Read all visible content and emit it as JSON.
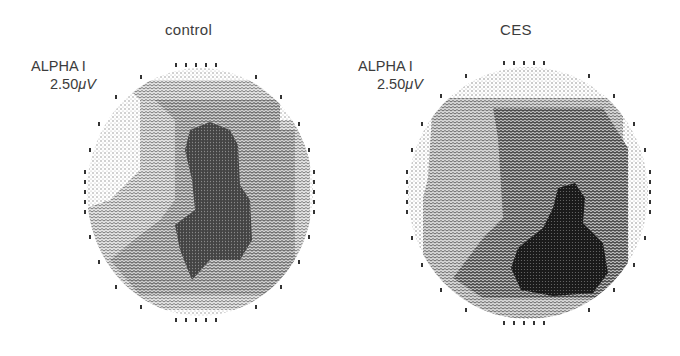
{
  "figure": {
    "panels": [
      {
        "id": "control",
        "title": "control",
        "band": "ALPHA I",
        "scale_value": "2.50",
        "scale_unit_prefix": "μ",
        "scale_unit": "V"
      },
      {
        "id": "ces",
        "title": "CES",
        "band": "ALPHA I",
        "scale_value": "2.50",
        "scale_unit_prefix": "μ",
        "scale_unit": "V"
      }
    ],
    "colors": {
      "background": "#ffffff",
      "text": "#3c3c3c",
      "shade_lightest": "#d9d9d9",
      "shade_light": "#b8b8b8",
      "shade_mid": "#8f8f8f",
      "shade_dark": "#5a5a5a",
      "shade_darkest": "#1e1e1e"
    }
  }
}
